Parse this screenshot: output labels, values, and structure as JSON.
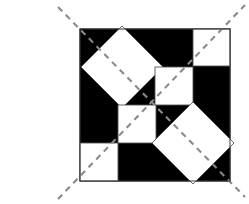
{
  "figure": {
    "panel_label": "(c)",
    "caption_position": "left",
    "background_color": "#ffffff",
    "tile_fill_color": "#000000",
    "shape_fill_color": "#ffffff",
    "shape_stroke_color": "#555555",
    "dash_color": "#8a8a8a",
    "square": {
      "x": 80,
      "y": 29,
      "width": 150,
      "height": 152
    },
    "grid": {
      "columns": 4,
      "rows": 4,
      "cell_width": 37.5,
      "cell_height": 38
    },
    "shapes": [
      {
        "name": "large-diamond-upper-left",
        "type": "diamond",
        "cx": 122,
        "cy": 67,
        "radius": 41
      },
      {
        "name": "small-square-top-right",
        "type": "square",
        "x": 193,
        "y": 29,
        "size": 37
      },
      {
        "name": "small-square-center-upper",
        "type": "square",
        "x": 155,
        "y": 67,
        "size": 38
      },
      {
        "name": "small-square-center-lower",
        "type": "square",
        "x": 118,
        "y": 105,
        "size": 38
      },
      {
        "name": "small-square-bottom-left",
        "type": "square",
        "x": 80,
        "y": 143,
        "size": 38
      },
      {
        "name": "large-diamond-lower-right",
        "type": "diamond",
        "cx": 193,
        "cy": 143,
        "radius": 41
      }
    ],
    "dashed_lines": [
      {
        "name": "main-diagonal",
        "x1": 58,
        "y1": 7,
        "x2": 245,
        "y2": 197,
        "pattern": "6 5"
      },
      {
        "name": "anti-diagonal",
        "x1": 58,
        "y1": 199,
        "x2": 245,
        "y2": 5,
        "pattern": "6 5"
      }
    ]
  }
}
